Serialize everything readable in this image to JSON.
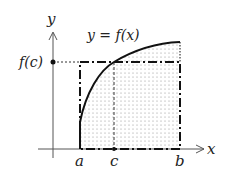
{
  "diagram": {
    "labels": {
      "y_axis": "y",
      "x_axis": "x",
      "curve": "y = f(x)",
      "fc": "f(c)",
      "a": "a",
      "b": "b",
      "c": "c"
    },
    "colors": {
      "line": "#111111",
      "axis": "#555555",
      "dots": "#9a9a9a",
      "background": "#ffffff"
    },
    "elements": {
      "curve": "concave-down increasing curve from x=a to x=b",
      "shaded_region": "dotted region under curve between a and b",
      "rectangle": "dash-dot rectangle of height f(c) over [a, b]",
      "guide_lines": "dotted horizontal from f(c) on y-axis and dashed vertical at c"
    }
  }
}
